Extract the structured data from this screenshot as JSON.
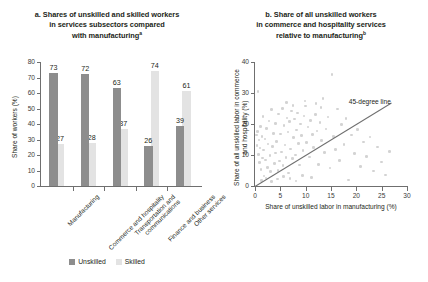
{
  "figure": {
    "panel_a": {
      "title_line1": "a. Shares of unskilled and skilled workers",
      "title_line2": "in services subsectors compared",
      "title_line3": "with manufacturing",
      "title_superscript": "a",
      "legend": [
        {
          "label": "Unskilled",
          "color": "#8d8d8d"
        },
        {
          "label": "Skilled",
          "color": "#e3e3e3"
        }
      ]
    },
    "panel_b": {
      "title_line1": "b. Share of all unskilled workers",
      "title_line2": "in commerce and hospitality services",
      "title_line3": "relative to manufacturing",
      "title_superscript": "b",
      "annotation": "45-degree line"
    }
  },
  "chart_data": [
    {
      "type": "bar",
      "panel": "a",
      "title": "a. Shares of unskilled and skilled workers in services subsectors compared with manufacturing",
      "xlabel": "",
      "ylabel": "Share of workers (%)",
      "ylim": [
        0,
        80
      ],
      "yticks": [
        0,
        10,
        20,
        30,
        40,
        50,
        60,
        70,
        80
      ],
      "ytick_labels": [
        "0",
        "10",
        "20",
        "30",
        "40",
        "50",
        "60",
        "70",
        "80"
      ],
      "grid": false,
      "legend_position": "bottom-center",
      "categories": [
        "Manufacturing",
        "Commerce and hospitality",
        "Transportation and communications",
        "Finance and business",
        "Other services"
      ],
      "series": [
        {
          "name": "Unskilled",
          "color": "#8d8d8d",
          "values": [
            73,
            72,
            63,
            26,
            39
          ]
        },
        {
          "name": "Skilled",
          "color": "#e3e3e3",
          "values": [
            27,
            28,
            37,
            74,
            61
          ]
        }
      ]
    },
    {
      "type": "scatter",
      "panel": "b",
      "title": "b. Share of all unskilled workers in commerce and hospitality services relative to manufacturing",
      "xlabel": "Share of unskilled labor in manufacturing (%)",
      "ylabel": "Share of all unskilled labor in commerce and hospitality (%)",
      "xlim": [
        0,
        30
      ],
      "ylim": [
        0,
        40
      ],
      "xticks": [
        0,
        5,
        10,
        15,
        20,
        25,
        30
      ],
      "xtick_labels": [
        "0",
        "5",
        "10",
        "15",
        "20",
        "25",
        "30"
      ],
      "yticks": [
        0,
        10,
        20,
        30,
        40
      ],
      "ytick_labels": [
        "0",
        "10",
        "20",
        "30",
        "40"
      ],
      "grid": false,
      "point_color": "#d3d3d3",
      "reference_line": {
        "label": "45-degree line",
        "color": "#6f6f6f",
        "from": [
          0,
          0
        ],
        "to": [
          27,
          27
        ]
      },
      "points": [
        [
          0.3,
          16.4
        ],
        [
          0.4,
          13.0
        ],
        [
          0.5,
          17.6
        ],
        [
          0.6,
          30.4
        ],
        [
          0.7,
          10.2
        ],
        [
          0.8,
          14.8
        ],
        [
          0.9,
          7.6
        ],
        [
          1.0,
          12.2
        ],
        [
          1.1,
          19.2
        ],
        [
          1.2,
          5.4
        ],
        [
          1.4,
          16.0
        ],
        [
          1.5,
          9.0
        ],
        [
          1.6,
          22.4
        ],
        [
          1.7,
          11.6
        ],
        [
          1.8,
          3.2
        ],
        [
          2.0,
          15.2
        ],
        [
          2.1,
          8.4
        ],
        [
          2.3,
          18.6
        ],
        [
          2.5,
          6.0
        ],
        [
          2.6,
          13.6
        ],
        [
          2.8,
          21.0
        ],
        [
          3.0,
          9.8
        ],
        [
          3.1,
          4.6
        ],
        [
          3.3,
          24.6
        ],
        [
          3.5,
          12.8
        ],
        [
          3.6,
          17.0
        ],
        [
          3.8,
          7.2
        ],
        [
          4.0,
          20.2
        ],
        [
          4.1,
          10.6
        ],
        [
          4.3,
          14.4
        ],
        [
          4.5,
          5.0
        ],
        [
          4.6,
          23.2
        ],
        [
          4.8,
          8.0
        ],
        [
          5.0,
          16.8
        ],
        [
          5.2,
          11.0
        ],
        [
          5.4,
          25.0
        ],
        [
          5.5,
          6.6
        ],
        [
          5.7,
          19.6
        ],
        [
          5.9,
          13.2
        ],
        [
          6.1,
          9.2
        ],
        [
          6.3,
          22.0
        ],
        [
          6.5,
          17.4
        ],
        [
          6.6,
          4.2
        ],
        [
          6.8,
          20.8
        ],
        [
          7.0,
          12.0
        ],
        [
          7.2,
          24.2
        ],
        [
          7.4,
          8.8
        ],
        [
          7.6,
          15.6
        ],
        [
          7.8,
          21.6
        ],
        [
          8.0,
          10.0
        ],
        [
          8.2,
          18.0
        ],
        [
          8.4,
          23.6
        ],
        [
          8.6,
          13.8
        ],
        [
          8.8,
          6.8
        ],
        [
          9.0,
          20.0
        ],
        [
          9.2,
          16.2
        ],
        [
          9.5,
          11.4
        ],
        [
          9.7,
          22.6
        ],
        [
          10.0,
          25.8
        ],
        [
          10.2,
          14.0
        ],
        [
          10.5,
          19.0
        ],
        [
          10.8,
          9.4
        ],
        [
          11.0,
          21.2
        ],
        [
          11.3,
          16.6
        ],
        [
          11.6,
          12.4
        ],
        [
          11.9,
          23.0
        ],
        [
          12.2,
          17.8
        ],
        [
          12.5,
          7.0
        ],
        [
          12.8,
          20.4
        ],
        [
          13.1,
          14.6
        ],
        [
          13.4,
          28.2
        ],
        [
          13.7,
          10.8
        ],
        [
          14.0,
          18.4
        ],
        [
          14.4,
          22.2
        ],
        [
          14.8,
          5.8
        ],
        [
          15.2,
          36.0
        ],
        [
          15.5,
          16.0
        ],
        [
          15.9,
          11.8
        ],
        [
          16.3,
          24.8
        ],
        [
          16.7,
          8.2
        ],
        [
          17.1,
          19.8
        ],
        [
          17.6,
          13.4
        ],
        [
          18.0,
          21.8
        ],
        [
          18.5,
          2.0
        ],
        [
          19.0,
          16.4
        ],
        [
          19.6,
          10.4
        ],
        [
          20.2,
          18.2
        ],
        [
          20.8,
          6.2
        ],
        [
          21.4,
          14.2
        ],
        [
          22.0,
          9.6
        ],
        [
          22.7,
          15.8
        ],
        [
          23.4,
          4.8
        ],
        [
          24.2,
          12.6
        ],
        [
          25.0,
          7.8
        ],
        [
          25.8,
          3.6
        ],
        [
          26.6,
          11.2
        ],
        [
          1.3,
          1.8
        ],
        [
          2.2,
          2.6
        ],
        [
          3.2,
          1.4
        ],
        [
          4.4,
          2.2
        ],
        [
          5.6,
          3.0
        ],
        [
          6.9,
          2.4
        ],
        [
          8.1,
          1.6
        ],
        [
          9.4,
          3.4
        ],
        [
          11.1,
          2.8
        ],
        [
          12.0,
          26.6
        ],
        [
          7.5,
          26.0
        ],
        [
          9.9,
          27.4
        ],
        [
          13.0,
          25.4
        ],
        [
          6.2,
          27.0
        ]
      ]
    }
  ]
}
